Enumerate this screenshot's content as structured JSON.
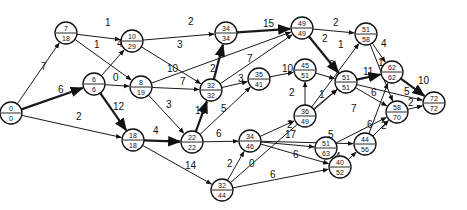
{
  "diagram": {
    "type": "activity-network",
    "nodes": [
      {
        "id": "n0",
        "x": 11,
        "y": 113,
        "top": "0",
        "bottom": "0"
      },
      {
        "id": "n1",
        "x": 66,
        "y": 33,
        "top": "7",
        "bottom": "18"
      },
      {
        "id": "n2",
        "x": 94,
        "y": 84,
        "top": "6",
        "bottom": "6"
      },
      {
        "id": "n3",
        "x": 132,
        "y": 41,
        "top": "10",
        "bottom": "29"
      },
      {
        "id": "n4",
        "x": 141,
        "y": 87,
        "top": "8",
        "bottom": "19"
      },
      {
        "id": "n5",
        "x": 133,
        "y": 140,
        "top": "18",
        "bottom": "18"
      },
      {
        "id": "n6",
        "x": 226,
        "y": 33,
        "top": "34",
        "bottom": "34"
      },
      {
        "id": "n7",
        "x": 211,
        "y": 90,
        "top": "32",
        "bottom": "32"
      },
      {
        "id": "n8",
        "x": 192,
        "y": 142,
        "top": "22",
        "bottom": "22"
      },
      {
        "id": "n9",
        "x": 259,
        "y": 79,
        "top": "35",
        "bottom": "41"
      },
      {
        "id": "n10",
        "x": 302,
        "y": 28,
        "top": "49",
        "bottom": "49"
      },
      {
        "id": "n11",
        "x": 305,
        "y": 70,
        "top": "45",
        "bottom": "51"
      },
      {
        "id": "n12",
        "x": 305,
        "y": 116,
        "top": "36",
        "bottom": "49"
      },
      {
        "id": "n13",
        "x": 250,
        "y": 141,
        "top": "34",
        "bottom": "46"
      },
      {
        "id": "n14",
        "x": 222,
        "y": 190,
        "top": "32",
        "bottom": "44"
      },
      {
        "id": "n15",
        "x": 366,
        "y": 34,
        "top": "51",
        "bottom": "58"
      },
      {
        "id": "n16",
        "x": 346,
        "y": 82,
        "top": "51",
        "bottom": "51"
      },
      {
        "id": "n17",
        "x": 326,
        "y": 148,
        "top": "51",
        "bottom": "63"
      },
      {
        "id": "n18",
        "x": 392,
        "y": 72,
        "top": "62",
        "bottom": "62"
      },
      {
        "id": "n19",
        "x": 397,
        "y": 112,
        "top": "58",
        "bottom": "70"
      },
      {
        "id": "n20",
        "x": 340,
        "y": 167,
        "top": "40",
        "bottom": "52"
      },
      {
        "id": "n21",
        "x": 365,
        "y": 144,
        "top": "44",
        "bottom": "56"
      },
      {
        "id": "n22",
        "x": 434,
        "y": 103,
        "top": "72",
        "bottom": "72"
      }
    ],
    "edges": [
      {
        "from": "n0",
        "to": "n1",
        "weight": "7",
        "critical": false,
        "lx": 41,
        "ly": 70
      },
      {
        "from": "n0",
        "to": "n2",
        "weight": "6",
        "critical": true,
        "lx": 58,
        "ly": 93
      },
      {
        "from": "n0",
        "to": "n5",
        "weight": "2",
        "critical": false,
        "lx": 76,
        "ly": 120
      },
      {
        "from": "n1",
        "to": "n3",
        "weight": "1",
        "critical": false,
        "lx": 105,
        "ly": 26
      },
      {
        "from": "n1",
        "to": "n4",
        "weight": "1",
        "critical": false,
        "lx": 94,
        "ly": 48
      },
      {
        "from": "n2",
        "to": "n3",
        "weight": "4",
        "critical": false,
        "lx": 117,
        "ly": 47
      },
      {
        "from": "n2",
        "to": "n4",
        "weight": "0",
        "critical": false,
        "lx": 113,
        "ly": 81
      },
      {
        "from": "n2",
        "to": "n5",
        "weight": "12",
        "critical": true,
        "lx": 113,
        "ly": 110
      },
      {
        "from": "n3",
        "to": "n6",
        "weight": "2",
        "critical": false,
        "lx": 188,
        "ly": 25
      },
      {
        "from": "n3",
        "to": "n7",
        "weight": "3",
        "critical": false,
        "lx": 177,
        "ly": 48
      },
      {
        "from": "n4",
        "to": "n10",
        "weight": "10",
        "critical": false,
        "lx": 167,
        "ly": 72
      },
      {
        "from": "n4",
        "to": "n7",
        "weight": "7",
        "critical": false,
        "lx": 180,
        "ly": 85
      },
      {
        "from": "n4",
        "to": "n8",
        "weight": "3",
        "critical": false,
        "lx": 166,
        "ly": 108
      },
      {
        "from": "n5",
        "to": "n8",
        "weight": "4",
        "critical": true,
        "lx": 153,
        "ly": 134
      },
      {
        "from": "n5",
        "to": "n14",
        "weight": "14",
        "critical": false,
        "lx": 185,
        "ly": 169
      },
      {
        "from": "n8",
        "to": "n7",
        "weight": "10",
        "critical": true,
        "lx": 195,
        "ly": 114
      },
      {
        "from": "n8",
        "to": "n9",
        "weight": "5",
        "critical": false,
        "lx": 221,
        "ly": 112
      },
      {
        "from": "n8",
        "to": "n13",
        "weight": "6",
        "critical": false,
        "lx": 216,
        "ly": 137
      },
      {
        "from": "n7",
        "to": "n6",
        "weight": "2",
        "critical": true,
        "lx": 210,
        "ly": 72
      },
      {
        "from": "n7",
        "to": "n10",
        "weight": "7",
        "critical": false,
        "lx": 247,
        "ly": 62
      },
      {
        "from": "n7",
        "to": "n9",
        "weight": "3",
        "critical": false,
        "lx": 238,
        "ly": 82
      },
      {
        "from": "n6",
        "to": "n10",
        "weight": "15",
        "critical": true,
        "lx": 263,
        "ly": 27
      },
      {
        "from": "n9",
        "to": "n11",
        "weight": "10",
        "critical": false,
        "lx": 282,
        "ly": 72
      },
      {
        "from": "n10",
        "to": "n15",
        "weight": "2",
        "critical": false,
        "lx": 333,
        "ly": 26
      },
      {
        "from": "n10",
        "to": "n16",
        "weight": "2",
        "critical": true,
        "lx": 322,
        "ly": 42
      },
      {
        "from": "n11",
        "to": "n16",
        "weight": "0",
        "critical": false,
        "lx": 329,
        "ly": 68
      },
      {
        "from": "n12",
        "to": "n15",
        "weight": "1",
        "critical": false,
        "lx": 338,
        "ly": 48
      },
      {
        "from": "n12",
        "to": "n11",
        "weight": "2",
        "critical": false,
        "lx": 289,
        "ly": 96
      },
      {
        "from": "n12",
        "to": "n16",
        "weight": "1",
        "critical": false,
        "lx": 319,
        "ly": 98
      },
      {
        "from": "n13",
        "to": "n12",
        "weight": "2",
        "critical": false,
        "lx": 287,
        "ly": 128
      },
      {
        "from": "n13",
        "to": "n17",
        "weight": "17",
        "critical": false,
        "lx": 285,
        "ly": 138
      },
      {
        "from": "n13",
        "to": "n21",
        "weight": "5",
        "critical": false,
        "lx": 328,
        "ly": 138
      },
      {
        "from": "n13",
        "to": "n20",
        "weight": "6",
        "critical": false,
        "lx": 293,
        "ly": 158
      },
      {
        "from": "n14",
        "to": "n13",
        "weight": "2",
        "critical": false,
        "lx": 227,
        "ly": 167
      },
      {
        "from": "n14",
        "to": "n16",
        "weight": "0",
        "critical": false,
        "lx": 249,
        "ly": 167
      },
      {
        "from": "n14",
        "to": "n20",
        "weight": "6",
        "critical": false,
        "lx": 270,
        "ly": 178
      },
      {
        "from": "n15",
        "to": "n18",
        "weight": "4",
        "critical": false,
        "lx": 381,
        "ly": 47
      },
      {
        "from": "n15",
        "to": "n19",
        "weight": "1",
        "critical": false,
        "lx": 378,
        "ly": 66
      },
      {
        "from": "n16",
        "to": "n18",
        "weight": "11",
        "critical": true,
        "lx": 363,
        "ly": 75
      },
      {
        "from": "n16",
        "to": "n19",
        "weight": "6",
        "critical": false,
        "lx": 371,
        "ly": 96
      },
      {
        "from": "n16",
        "to": "n22",
        "weight": "5",
        "critical": false,
        "lx": 404,
        "ly": 95
      },
      {
        "from": "n17",
        "to": "n19",
        "weight": "7",
        "critical": false,
        "lx": 351,
        "ly": 112
      },
      {
        "from": "n20",
        "to": "n21",
        "weight": "4",
        "critical": false,
        "lx": 335,
        "ly": 160
      },
      {
        "from": "n21",
        "to": "n18",
        "weight": "6",
        "critical": false,
        "lx": 367,
        "ly": 128
      },
      {
        "from": "n21",
        "to": "n19",
        "weight": "2",
        "critical": false,
        "lx": 381,
        "ly": 129
      },
      {
        "from": "n18",
        "to": "n22",
        "weight": "10",
        "critical": true,
        "lx": 418,
        "ly": 84
      },
      {
        "from": "n19",
        "to": "n22",
        "weight": "2",
        "critical": false,
        "lx": 408,
        "ly": 106
      }
    ]
  }
}
